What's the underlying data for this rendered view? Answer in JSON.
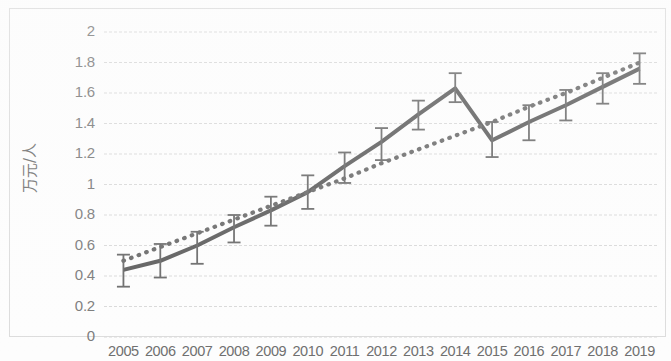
{
  "chart_data": {
    "type": "line",
    "title": "",
    "xlabel": "",
    "ylabel": "万元/人",
    "categories": [
      "2005",
      "2006",
      "2007",
      "2008",
      "2009",
      "2010",
      "2011",
      "2012",
      "2013",
      "2014",
      "2015",
      "2016",
      "2017",
      "2018",
      "2019"
    ],
    "ylim": [
      0,
      2
    ],
    "ytick_values": [
      "0",
      "0.2",
      "0.4",
      "0.6",
      "0.8",
      "1",
      "1.2",
      "1.4",
      "1.6",
      "1.8",
      "2"
    ],
    "grid": true,
    "legend": "none",
    "series": [
      {
        "name": "人均值",
        "style": "solid",
        "color": "#5e5e5e",
        "values": [
          0.44,
          0.5,
          0.6,
          0.72,
          0.83,
          0.95,
          1.12,
          1.28,
          1.46,
          1.63,
          1.29,
          1.41,
          1.52,
          1.64,
          1.76
        ],
        "error_upper": [
          0.54,
          0.61,
          0.69,
          0.8,
          0.92,
          1.06,
          1.21,
          1.37,
          1.55,
          1.73,
          1.41,
          1.52,
          1.62,
          1.73,
          1.86
        ],
        "error_lower": [
          0.33,
          0.39,
          0.48,
          0.62,
          0.73,
          0.84,
          1.01,
          1.16,
          1.36,
          1.54,
          1.18,
          1.29,
          1.42,
          1.53,
          1.66
        ]
      },
      {
        "name": "趋势线",
        "style": "dotted",
        "color": "#6b6b6b",
        "values": [
          0.5,
          0.59,
          0.68,
          0.77,
          0.86,
          0.95,
          1.04,
          1.14,
          1.23,
          1.32,
          1.41,
          1.51,
          1.6,
          1.7,
          1.8
        ]
      }
    ]
  },
  "axis": {
    "y_title": "万元/人"
  }
}
